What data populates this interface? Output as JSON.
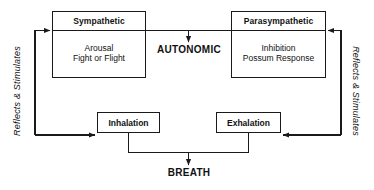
{
  "diagram": {
    "line_color": "#1a1a1a",
    "background_color": "#ffffff",
    "text_color": "#111111"
  },
  "nodes": {
    "sympathetic": {
      "header": "Sympathetic",
      "body_line_1": "Arousal",
      "body_line_2": "Fight or Flight"
    },
    "parasympathetic": {
      "header": "Parasympathetic",
      "body_line_1": "Inhibition",
      "body_line_2": "Possum Response"
    },
    "inhalation": {
      "label": "Inhalation"
    },
    "exhalation": {
      "label": "Exhalation"
    }
  },
  "captions": {
    "autonomic": "AUTONOMIC",
    "breath": "BREATH"
  },
  "side_labels": {
    "left": "Reflects & Stimulates",
    "right": "Reflects & Stimulates"
  }
}
